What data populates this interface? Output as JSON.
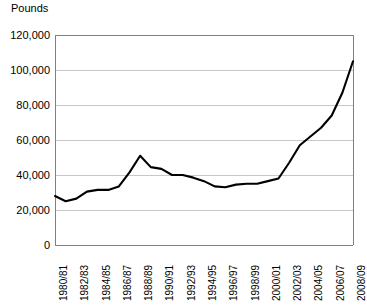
{
  "chart": {
    "unit_label": "Pounds"
  },
  "chart_data": {
    "type": "line",
    "title": "",
    "subtitle": "",
    "xlabel": "",
    "ylabel": "Pounds",
    "ylim": [
      0,
      120000
    ],
    "ytick_labels": [
      "120,000",
      "100,000",
      "80,000",
      "60,000",
      "40,000",
      "20,000",
      "0"
    ],
    "ytick_values": [
      120000,
      100000,
      80000,
      60000,
      40000,
      20000,
      0
    ],
    "grid": true,
    "grid_axis": "y",
    "legend": false,
    "legend_position": "none",
    "line_color": "#000000",
    "grid_color": "#c8c8c8",
    "axis_color": "#808080",
    "xtick_labels": [
      "1980/81",
      "1982/83",
      "1984/85",
      "1986/87",
      "1988/89",
      "1990/91",
      "1992/93",
      "1994/95",
      "1996/97",
      "1998/99",
      "2000/01",
      "2002/03",
      "2004/05",
      "2006/07",
      "2008/09"
    ],
    "categories": [
      "1980/81",
      "1981/82",
      "1982/83",
      "1983/84",
      "1984/85",
      "1985/86",
      "1986/87",
      "1987/88",
      "1988/89",
      "1989/90",
      "1990/91",
      "1991/92",
      "1992/93",
      "1993/94",
      "1994/95",
      "1995/96",
      "1996/97",
      "1997/98",
      "1998/99",
      "1999/00",
      "2000/01",
      "2001/02",
      "2002/03",
      "2003/04",
      "2004/05",
      "2005/06",
      "2006/07",
      "2007/08",
      "2008/09"
    ],
    "values": [
      28000,
      25000,
      26500,
      30500,
      31500,
      31500,
      33500,
      41500,
      51000,
      44500,
      43500,
      40000,
      40000,
      38500,
      36500,
      33500,
      33000,
      34500,
      35000,
      35000,
      36500,
      38000,
      47000,
      57000,
      62000,
      67000,
      74000,
      87000,
      105000
    ]
  }
}
